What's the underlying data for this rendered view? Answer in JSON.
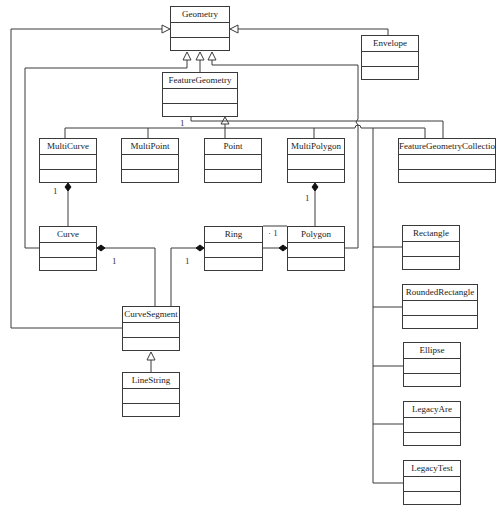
{
  "diagram": {
    "type": "UML class diagram",
    "classes": [
      {
        "id": "geometry",
        "name": "Geometry",
        "x": 170,
        "y": 6,
        "w": 60,
        "h": 45
      },
      {
        "id": "envelope",
        "name": "Envelope",
        "x": 361,
        "y": 35,
        "w": 58,
        "h": 45
      },
      {
        "id": "feature-geometry",
        "name": "FeatureGeometry",
        "x": 162,
        "y": 72,
        "w": 76,
        "h": 45
      },
      {
        "id": "multicurve",
        "name": "MultiCurve",
        "x": 39,
        "y": 138,
        "w": 58,
        "h": 45
      },
      {
        "id": "multipoint",
        "name": "MultiPoint",
        "x": 121,
        "y": 138,
        "w": 58,
        "h": 45
      },
      {
        "id": "point",
        "name": "Point",
        "x": 204,
        "y": 138,
        "w": 58,
        "h": 45
      },
      {
        "id": "multipolygon",
        "name": "MultiPolygon",
        "x": 287,
        "y": 138,
        "w": 58,
        "h": 45
      },
      {
        "id": "feature-geometry-collection",
        "name": "FeatureGeometryCollection",
        "x": 398,
        "y": 138,
        "w": 98,
        "h": 45
      },
      {
        "id": "curve",
        "name": "Curve",
        "x": 39,
        "y": 226,
        "w": 58,
        "h": 45
      },
      {
        "id": "ring",
        "name": "Ring",
        "x": 204,
        "y": 226,
        "w": 59,
        "h": 45
      },
      {
        "id": "polygon",
        "name": "Polygon",
        "x": 287,
        "y": 226,
        "w": 58,
        "h": 45
      },
      {
        "id": "curve-segment",
        "name": "CurveSegment",
        "x": 122,
        "y": 306,
        "w": 58,
        "h": 45
      },
      {
        "id": "linestring",
        "name": "LineString",
        "x": 122,
        "y": 372,
        "w": 58,
        "h": 45
      },
      {
        "id": "rectangle",
        "name": "Rectangle",
        "x": 402,
        "y": 225,
        "w": 58,
        "h": 45
      },
      {
        "id": "rounded-rectangle",
        "name": "RoundedRectangle",
        "x": 402,
        "y": 284,
        "w": 76,
        "h": 45
      },
      {
        "id": "ellipse",
        "name": "Ellipse",
        "x": 403,
        "y": 342,
        "w": 58,
        "h": 45
      },
      {
        "id": "legacy-arc",
        "name": "LegacyAre",
        "x": 403,
        "y": 401,
        "w": 58,
        "h": 45
      },
      {
        "id": "legacy-text",
        "name": "LegacyTest",
        "x": 403,
        "y": 460,
        "w": 58,
        "h": 45
      }
    ],
    "multiplicities": [
      {
        "id": "fg-children",
        "text": "1",
        "x": 180,
        "y": 118
      },
      {
        "id": "multicurve-curve",
        "text": "1",
        "x": 53,
        "y": 186
      },
      {
        "id": "multipolygon-polygon",
        "text": "1",
        "x": 305,
        "y": 193
      },
      {
        "id": "curve-curvesegment",
        "text": "1",
        "x": 112,
        "y": 256
      },
      {
        "id": "ring-curvesegment",
        "text": "1",
        "x": 185,
        "y": 256
      },
      {
        "id": "polygon-ring",
        "text": "· 1",
        "x": 268,
        "y": 228
      }
    ],
    "relationships": [
      {
        "from": "Envelope",
        "to": "Geometry",
        "kind": "generalization"
      },
      {
        "from": "FeatureGeometry",
        "to": "Geometry",
        "kind": "generalization"
      },
      {
        "from": "Curve",
        "to": "Geometry",
        "kind": "generalization"
      },
      {
        "from": "CurveSegment",
        "to": "Geometry",
        "kind": "generalization"
      },
      {
        "from": "Polygon",
        "to": "Geometry",
        "kind": "generalization"
      },
      {
        "from": "MultiCurve",
        "to": "FeatureGeometry",
        "kind": "generalization"
      },
      {
        "from": "MultiPoint",
        "to": "FeatureGeometry",
        "kind": "generalization"
      },
      {
        "from": "Point",
        "to": "FeatureGeometry",
        "kind": "generalization"
      },
      {
        "from": "MultiPolygon",
        "to": "FeatureGeometry",
        "kind": "generalization"
      },
      {
        "from": "FeatureGeometryCollection",
        "to": "FeatureGeometry",
        "kind": "generalization"
      },
      {
        "from": "Rectangle",
        "to": "FeatureGeometry",
        "kind": "generalization"
      },
      {
        "from": "RoundedRectangle",
        "to": "FeatureGeometry",
        "kind": "generalization"
      },
      {
        "from": "Ellipse",
        "to": "FeatureGeometry",
        "kind": "generalization"
      },
      {
        "from": "LegacyAre",
        "to": "FeatureGeometry",
        "kind": "generalization"
      },
      {
        "from": "LegacyTest",
        "to": "FeatureGeometry",
        "kind": "generalization"
      },
      {
        "from": "LineString",
        "to": "CurveSegment",
        "kind": "generalization"
      },
      {
        "from": "MultiCurve",
        "to": "Curve",
        "kind": "composition"
      },
      {
        "from": "MultiPolygon",
        "to": "Polygon",
        "kind": "composition"
      },
      {
        "from": "Curve",
        "to": "CurveSegment",
        "kind": "composition"
      },
      {
        "from": "Ring",
        "to": "CurveSegment",
        "kind": "composition"
      },
      {
        "from": "Polygon",
        "to": "Ring",
        "kind": "composition"
      }
    ]
  }
}
